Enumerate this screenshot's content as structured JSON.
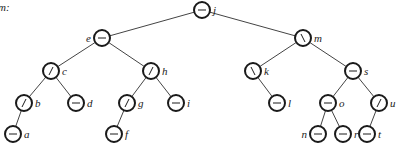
{
  "caption": "m:",
  "diagram": {
    "type": "binary-tree",
    "node_radius": 8,
    "colors": {
      "stroke": "#1a1a1a",
      "edge": "#444444",
      "fill": "#ffffff",
      "label": "#222222"
    },
    "nodes": [
      {
        "id": "j",
        "label": "j",
        "balance": "-",
        "x": 202,
        "y": 10,
        "label_side": "right"
      },
      {
        "id": "e",
        "label": "e",
        "balance": "-",
        "x": 102,
        "y": 38,
        "label_side": "left"
      },
      {
        "id": "m",
        "label": "m",
        "balance": "\\",
        "x": 303,
        "y": 38,
        "label_side": "right"
      },
      {
        "id": "c",
        "label": "c",
        "balance": "/",
        "x": 51,
        "y": 71,
        "label_side": "right"
      },
      {
        "id": "h",
        "label": "h",
        "balance": "/",
        "x": 151,
        "y": 71,
        "label_side": "right"
      },
      {
        "id": "k",
        "label": "k",
        "balance": "\\",
        "x": 253,
        "y": 71,
        "label_side": "right"
      },
      {
        "id": "s",
        "label": "s",
        "balance": "-",
        "x": 353,
        "y": 71,
        "label_side": "right"
      },
      {
        "id": "b",
        "label": "b",
        "balance": "/",
        "x": 24,
        "y": 103,
        "label_side": "right"
      },
      {
        "id": "d",
        "label": "d",
        "balance": "-",
        "x": 76,
        "y": 103,
        "label_side": "right"
      },
      {
        "id": "g",
        "label": "g",
        "balance": "/",
        "x": 127,
        "y": 103,
        "label_side": "right"
      },
      {
        "id": "i",
        "label": "i",
        "balance": "-",
        "x": 176,
        "y": 103,
        "label_side": "right"
      },
      {
        "id": "l",
        "label": "l",
        "balance": "-",
        "x": 277,
        "y": 103,
        "label_side": "right"
      },
      {
        "id": "o",
        "label": "o",
        "balance": "-",
        "x": 328,
        "y": 103,
        "label_side": "right"
      },
      {
        "id": "u",
        "label": "u",
        "balance": "/",
        "x": 379,
        "y": 103,
        "label_side": "right"
      },
      {
        "id": "a",
        "label": "a",
        "balance": "-",
        "x": 13,
        "y": 134,
        "label_side": "right"
      },
      {
        "id": "f",
        "label": "f",
        "balance": "-",
        "x": 114,
        "y": 134,
        "label_side": "right"
      },
      {
        "id": "n",
        "label": "n",
        "balance": "-",
        "x": 318,
        "y": 134,
        "label_side": "left"
      },
      {
        "id": "r",
        "label": "r",
        "balance": "-",
        "x": 343,
        "y": 134,
        "label_side": "right"
      },
      {
        "id": "t",
        "label": "t",
        "balance": "-",
        "x": 367,
        "y": 134,
        "label_side": "right"
      }
    ],
    "edges": [
      [
        "j",
        "e"
      ],
      [
        "j",
        "m"
      ],
      [
        "e",
        "c"
      ],
      [
        "e",
        "h"
      ],
      [
        "m",
        "k"
      ],
      [
        "m",
        "s"
      ],
      [
        "c",
        "b"
      ],
      [
        "c",
        "d"
      ],
      [
        "h",
        "g"
      ],
      [
        "h",
        "i"
      ],
      [
        "k",
        "l"
      ],
      [
        "s",
        "o"
      ],
      [
        "s",
        "u"
      ],
      [
        "b",
        "a"
      ],
      [
        "g",
        "f"
      ],
      [
        "o",
        "n"
      ],
      [
        "o",
        "r"
      ],
      [
        "u",
        "t"
      ]
    ]
  }
}
